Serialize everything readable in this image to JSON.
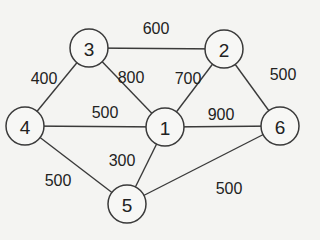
{
  "graph": {
    "type": "weighted-undirected-graph",
    "node_radius": 19,
    "nodes": [
      {
        "id": "1",
        "label": "1",
        "x": 165,
        "y": 127
      },
      {
        "id": "2",
        "label": "2",
        "x": 224,
        "y": 49
      },
      {
        "id": "3",
        "label": "3",
        "x": 89,
        "y": 48
      },
      {
        "id": "4",
        "label": "4",
        "x": 25,
        "y": 126
      },
      {
        "id": "5",
        "label": "5",
        "x": 127,
        "y": 204
      },
      {
        "id": "6",
        "label": "6",
        "x": 280,
        "y": 126
      }
    ],
    "edges": [
      {
        "from": "3",
        "to": "2",
        "weight": "600",
        "lx": 156,
        "ly": 28
      },
      {
        "from": "3",
        "to": "4",
        "weight": "400",
        "lx": 44,
        "ly": 78
      },
      {
        "from": "3",
        "to": "1",
        "weight": "800",
        "lx": 131,
        "ly": 77
      },
      {
        "from": "2",
        "to": "1",
        "weight": "700",
        "lx": 188,
        "ly": 78
      },
      {
        "from": "2",
        "to": "6",
        "weight": "500",
        "lx": 283,
        "ly": 74
      },
      {
        "from": "4",
        "to": "1",
        "weight": "500",
        "lx": 105,
        "ly": 112
      },
      {
        "from": "1",
        "to": "6",
        "weight": "900",
        "lx": 221,
        "ly": 114
      },
      {
        "from": "1",
        "to": "5",
        "weight": "300",
        "lx": 122,
        "ly": 160
      },
      {
        "from": "4",
        "to": "5",
        "weight": "500",
        "lx": 58,
        "ly": 180
      },
      {
        "from": "5",
        "to": "6",
        "weight": "500",
        "lx": 229,
        "ly": 188
      }
    ]
  }
}
